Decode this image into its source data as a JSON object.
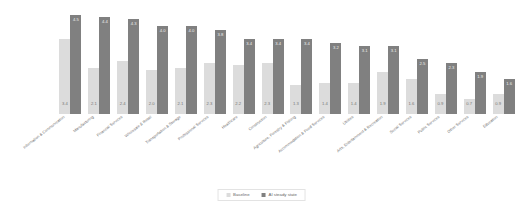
{
  "chart_data": {
    "type": "bar",
    "title": "",
    "subtitle": "",
    "xlabel": "",
    "ylabel": "",
    "ylim": [
      0,
      4.8
    ],
    "grid": false,
    "legend_position": "bottom-center",
    "categories": [
      "Information & Communication",
      "Manufacturing",
      "Financial Services",
      "Wholesale & Retail",
      "Transportation & Storage",
      "Professional Services",
      "Healthcare",
      "Construction",
      "Agriculture, Forestry & Fishing",
      "Accommodation & Food Services",
      "Utilities",
      "Arts, Entertainment & Recreation",
      "Social Services",
      "Public Services",
      "Other Services",
      "Education"
    ],
    "series": [
      {
        "name": "Baseline",
        "color": "#dcdcdc",
        "values": [
          3.4,
          2.1,
          2.4,
          2.0,
          2.1,
          2.3,
          2.2,
          2.3,
          1.3,
          1.4,
          1.4,
          1.9,
          1.6,
          0.9,
          0.7,
          0.9
        ]
      },
      {
        "name": "AI steady state",
        "color": "#808080",
        "values": [
          4.5,
          4.4,
          4.3,
          4.0,
          4.0,
          3.8,
          3.4,
          3.4,
          3.4,
          3.2,
          3.1,
          3.1,
          2.5,
          2.3,
          1.9,
          1.6
        ]
      }
    ]
  },
  "legend": {
    "items": [
      {
        "label": "Baseline",
        "color": "#dcdcdc"
      },
      {
        "label": "AI steady state",
        "color": "#808080"
      }
    ]
  },
  "colors": {
    "baseline": "#dcdcdc",
    "ai_steady_state": "#808080",
    "background": "#ffffff",
    "label_text": "#6a6a6a"
  }
}
